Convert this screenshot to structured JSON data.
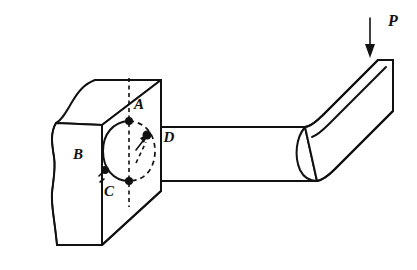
{
  "figure": {
    "type": "engineering-mechanics-diagram",
    "background_color": "#ffffff",
    "line_color": "#111111",
    "width": 417,
    "height": 270
  },
  "labels": {
    "point_a": "A",
    "point_b": "B",
    "point_c": "C",
    "point_d": "D",
    "load": "P"
  },
  "label_positions": {
    "point_a": {
      "x": 139,
      "y": 106
    },
    "point_b": {
      "x": 78,
      "y": 156
    },
    "point_c": {
      "x": 109,
      "y": 193
    },
    "point_d": {
      "x": 169,
      "y": 139
    },
    "load": {
      "x": 393,
      "y": 22
    }
  },
  "load_arrow": {
    "label": "P",
    "direction": "down",
    "x": 370,
    "y_start": 18,
    "y_end": 56
  },
  "geometry": {
    "wall_block": {
      "name": "support-wall-block",
      "front_face": "rectangle with torn/broken left edge",
      "top_face": "parallelogram receding up-right",
      "right_face": "vertical rectangle at beam root"
    },
    "beam": {
      "name": "cantilever-beam",
      "horizontal_segment": "runs right from wall",
      "bent_segment": "angles up and to the right",
      "cross_section": "circular, shown as ellipse at fixed end"
    },
    "cross_section_ellipse": {
      "center_x": 129,
      "center_y": 151,
      "radius_x": 26,
      "radius_y": 30,
      "solid_arc": "left half",
      "dashed_arc": "right half"
    },
    "nodes": [
      {
        "name": "node-a",
        "x": 129,
        "y": 121
      },
      {
        "name": "node-c",
        "x": 129,
        "y": 181
      },
      {
        "name": "node-left",
        "x": 105,
        "y": 170
      },
      {
        "name": "node-interior",
        "x": 147,
        "y": 135
      }
    ]
  }
}
